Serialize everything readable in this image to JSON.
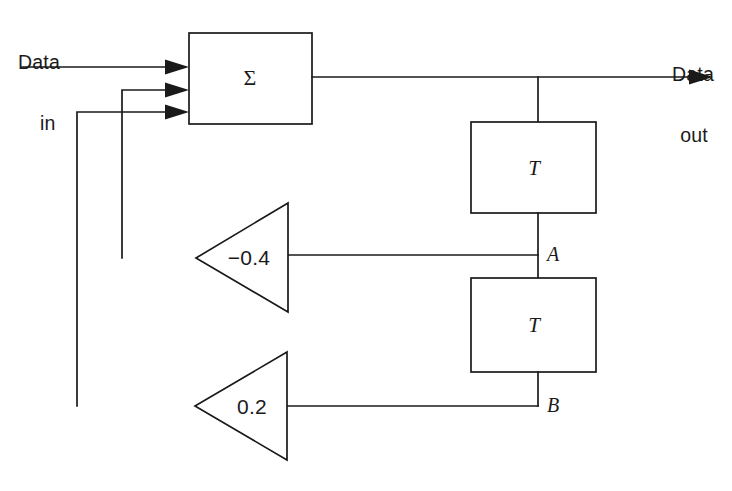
{
  "diagram": {
    "stroke_color": "#1a1a1a",
    "background_color": "#ffffff",
    "io": {
      "input_label_line1": "Data",
      "input_label_line2": "in",
      "output_label_line1": "Data",
      "output_label_line2": "out"
    },
    "blocks": [
      {
        "id": "summer",
        "label": "Σ",
        "kind": "summing-junction"
      },
      {
        "id": "delay-1",
        "label": "T",
        "kind": "delay"
      },
      {
        "id": "delay-2",
        "label": "T",
        "kind": "delay"
      }
    ],
    "gains": [
      {
        "id": "gain-upper",
        "label": "−0.4",
        "value": -0.4
      },
      {
        "id": "gain-lower",
        "label": "0.2",
        "value": 0.2
      }
    ],
    "nodes": [
      {
        "id": "node-a",
        "label": "A"
      },
      {
        "id": "node-b",
        "label": "B"
      }
    ]
  }
}
